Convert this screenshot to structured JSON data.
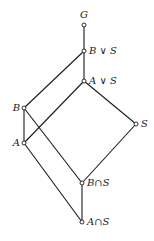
{
  "diagram": {
    "type": "lattice",
    "nodes": [
      {
        "id": "G",
        "label": "G",
        "x": 84,
        "y": 25,
        "lx": 80,
        "ly": 18,
        "anchor": "start"
      },
      {
        "id": "BvS",
        "label": "B ∨ S",
        "x": 84,
        "y": 51,
        "lx": 89,
        "ly": 54,
        "anchor": "start"
      },
      {
        "id": "AvS",
        "label": "A ∨ S",
        "x": 84,
        "y": 81,
        "lx": 89,
        "ly": 84,
        "anchor": "start"
      },
      {
        "id": "B",
        "label": "B",
        "x": 24,
        "y": 108,
        "lx": 20,
        "ly": 111,
        "anchor": "end"
      },
      {
        "id": "S",
        "label": "S",
        "x": 136,
        "y": 124,
        "lx": 141,
        "ly": 127,
        "anchor": "start"
      },
      {
        "id": "A",
        "label": "A",
        "x": 24,
        "y": 143,
        "lx": 20,
        "ly": 146,
        "anchor": "end"
      },
      {
        "id": "BnS",
        "label": "B∩S",
        "x": 82,
        "y": 183,
        "lx": 87,
        "ly": 186,
        "anchor": "start"
      },
      {
        "id": "AnS",
        "label": "A∩S",
        "x": 82,
        "y": 222,
        "lx": 87,
        "ly": 225,
        "anchor": "start"
      }
    ],
    "edges": [
      [
        "G",
        "BvS"
      ],
      [
        "BvS",
        "AvS"
      ],
      [
        "BvS",
        "B"
      ],
      [
        "AvS",
        "A"
      ],
      [
        "AvS",
        "S"
      ],
      [
        "B",
        "A"
      ],
      [
        "B",
        "BnS"
      ],
      [
        "A",
        "AnS"
      ],
      [
        "S",
        "BnS"
      ],
      [
        "BnS",
        "AnS"
      ]
    ],
    "colors": {
      "line": "#1a1a1a",
      "node_fill": "#ffffff",
      "background": "#ffffff"
    }
  }
}
